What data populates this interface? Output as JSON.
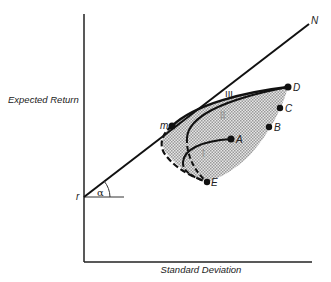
{
  "diagram": {
    "type": "efficient-frontier",
    "axes": {
      "y_label": "Expected Return",
      "x_label": "Standard Deviation"
    },
    "line": {
      "start_label": "r",
      "end_label": "N",
      "angle_label": "α"
    },
    "points": {
      "m": "m",
      "A": "A",
      "B": "B",
      "C": "C",
      "D": "D",
      "E": "E"
    },
    "curves": {
      "I": "I",
      "II": "II",
      "III": "III"
    },
    "colors": {
      "ink": "#111111",
      "shade": "#b8b8b8"
    }
  }
}
